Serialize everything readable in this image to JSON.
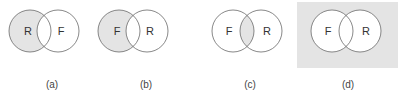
{
  "colors": {
    "shade": "#e4e4e4",
    "stroke": "#6a6a6a",
    "background": "#ffffff"
  },
  "panels": [
    {
      "id": "a",
      "caption": "(a)",
      "left_label": "R",
      "right_label": "F",
      "shaded": "left-only"
    },
    {
      "id": "b",
      "caption": "(b)",
      "left_label": "F",
      "right_label": "R",
      "shaded": "left-only"
    },
    {
      "id": "c",
      "caption": "(c)",
      "left_label": "F",
      "right_label": "R",
      "shaded": "intersection"
    },
    {
      "id": "d",
      "caption": "(d)",
      "left_label": "F",
      "right_label": "R",
      "shaded": "complement-of-union"
    }
  ]
}
